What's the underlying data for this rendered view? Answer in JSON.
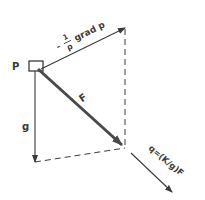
{
  "diagram": {
    "point_label": "P",
    "pressure_gradient_label": {
      "prefix": "-",
      "fraction_numerator": "1",
      "fraction_denominator": "ρ",
      "text": "grad p"
    },
    "force_label": "F",
    "gravity_label": "g",
    "flux_label": "q=(K/g)F",
    "colors": {
      "line": "#3a3a3a",
      "force_vector": "#4a4a4a",
      "background": "#ffffff"
    }
  }
}
